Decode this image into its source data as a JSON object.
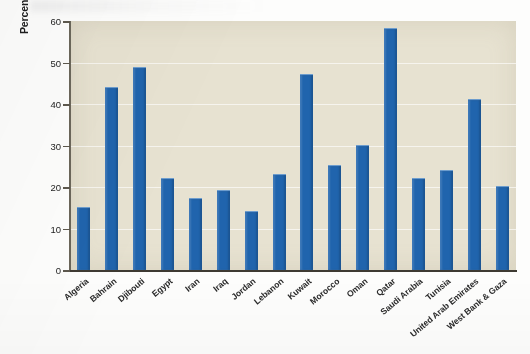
{
  "chart_data": {
    "type": "bar",
    "title": "",
    "subtitle": "",
    "xlabel": "",
    "ylabel": "Percentage of female labor force participation",
    "ylim": [
      0,
      60
    ],
    "ytick_labels": [
      "0",
      "10",
      "20",
      "30",
      "40",
      "50",
      "60"
    ],
    "ytick_values": [
      0,
      10,
      20,
      30,
      40,
      50,
      60
    ],
    "grid": true,
    "gridlines_horizontal": [
      10,
      20,
      30,
      40,
      50
    ],
    "legend": null,
    "legend_position": "none",
    "series_color": "#2064ad",
    "plot_background": "#e7e2d1",
    "categories": [
      "Algeria",
      "Bahrain",
      "Djibouti",
      "Egypt",
      "Iran",
      "Iraq",
      "Jordan",
      "Lebanon",
      "Kuwait",
      "Morocco",
      "Oman",
      "Qatar",
      "Saudi Arabia",
      "Tunisia",
      "United Arab Emirates",
      "West Bank & Gaza"
    ],
    "values": [
      15.2,
      44.0,
      49.0,
      22.2,
      17.3,
      19.2,
      14.2,
      23.2,
      47.3,
      25.3,
      30.2,
      58.2,
      22.2,
      24.0,
      41.2,
      20.2
    ],
    "series": [
      {
        "name": "Percentage of female labor force participation",
        "values": [
          15.2,
          44.0,
          49.0,
          22.2,
          17.3,
          19.2,
          14.2,
          23.2,
          47.3,
          25.3,
          30.2,
          58.2,
          22.2,
          24.0,
          41.2,
          20.2
        ]
      }
    ]
  }
}
